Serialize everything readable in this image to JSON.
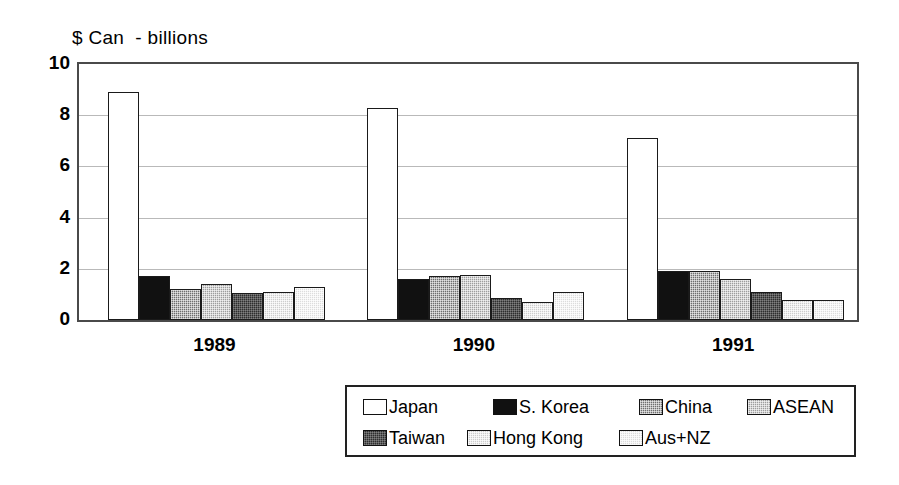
{
  "chart_data": {
    "type": "bar",
    "title": "$ Can  - billions",
    "xlabel": "",
    "ylabel": "",
    "ylim": [
      0,
      10
    ],
    "ytick_values": [
      10,
      8,
      6,
      4,
      2,
      0
    ],
    "ytick_labels": [
      "10",
      "8",
      "6",
      "4",
      "2",
      "0"
    ],
    "grid": true,
    "grid_axis": "y",
    "legend_position": "bottom",
    "categories": [
      "1989",
      "1990",
      "1991"
    ],
    "series": [
      {
        "name": "Japan",
        "color": "#ffffff",
        "pattern": "solid-white",
        "values": [
          8.9,
          8.3,
          7.1
        ]
      },
      {
        "name": "S. Korea",
        "color": "#111111",
        "pattern": "solid-black",
        "values": [
          1.7,
          1.6,
          1.9
        ]
      },
      {
        "name": "China",
        "color": "#6e6e6e",
        "pattern": "dense-dot",
        "values": [
          1.2,
          1.7,
          1.9
        ]
      },
      {
        "name": "ASEAN",
        "color": "#9d9d9d",
        "pattern": "medium-dot",
        "values": [
          1.4,
          1.75,
          1.6
        ]
      },
      {
        "name": "Taiwan",
        "color": "#2e2e2e",
        "pattern": "dark-dot",
        "values": [
          1.05,
          0.85,
          1.1
        ]
      },
      {
        "name": "Hong Kong",
        "color": "#cdcdcd",
        "pattern": "light-dot",
        "values": [
          1.1,
          0.7,
          0.8
        ]
      },
      {
        "name": "Aus+NZ",
        "color": "#dcdcdc",
        "pattern": "lighter-dot",
        "values": [
          1.3,
          1.1,
          0.8
        ]
      }
    ]
  }
}
